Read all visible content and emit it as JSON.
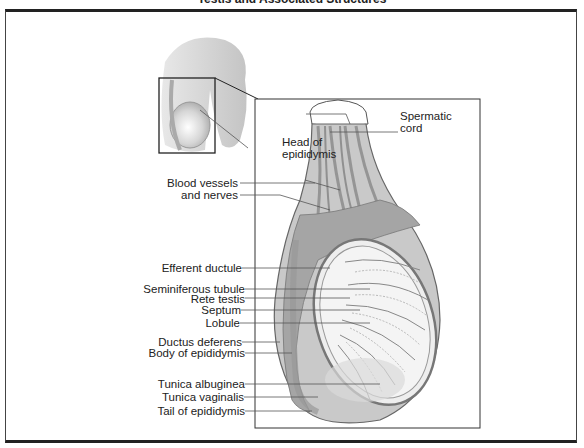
{
  "title": "Testis and Associated Structures",
  "labels": {
    "spermatic_cord": [
      "Spermatic",
      "cord"
    ],
    "head_of_epididymis": [
      "Head of",
      "epididymis"
    ],
    "blood_vessels": [
      "Blood vessels",
      "and nerves"
    ],
    "efferent_ductule": "Efferent ductule",
    "seminiferous_tubule": "Seminiferous tubule",
    "rete_testis": "Rete testis",
    "septum": "Septum",
    "lobule": "Lobule",
    "ductus_deferens": "Ductus deferens",
    "body_of_epididymis": "Body of epididymis",
    "tunica_albuginea": "Tunica albuginea",
    "tunica_vaginalis": "Tunica vaginalis",
    "tail_of_epididymis": "Tail of epididymis"
  },
  "colors": {
    "line": "#444444",
    "tissue_dark": "#8a8a8a",
    "tissue_mid": "#b5b5b5",
    "tissue_light": "#dcdcdc"
  }
}
